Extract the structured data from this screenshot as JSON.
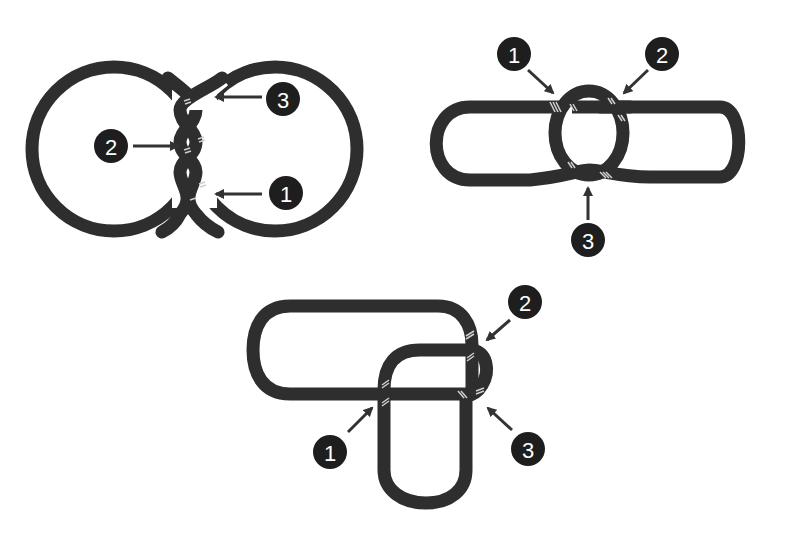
{
  "figure": {
    "background": "#ffffff",
    "rope_color": "#2e2e2e",
    "badge_color": "#1e1e1e",
    "panels": [
      {
        "id": "two-ring-twist",
        "description": "Two overlapping circles twisted together at their intersection",
        "labels": [
          {
            "number": "1",
            "target": "lower twist crossing"
          },
          {
            "number": "2",
            "target": "middle twist crossing"
          },
          {
            "number": "3",
            "target": "upper twist crossing"
          }
        ]
      },
      {
        "id": "ring-through-loop",
        "description": "Small oval ring passing through a long horizontal loop",
        "labels": [
          {
            "number": "1",
            "target": "upper-left crossing"
          },
          {
            "number": "2",
            "target": "upper-right crossing"
          },
          {
            "number": "3",
            "target": "bottom crossing"
          }
        ]
      },
      {
        "id": "interlocked-loops",
        "description": "Horizontal rounded loop interlocked with vertical rounded loop",
        "labels": [
          {
            "number": "1",
            "target": "left crossing"
          },
          {
            "number": "2",
            "target": "upper-right crossing"
          },
          {
            "number": "3",
            "target": "lower-right crossing"
          }
        ]
      }
    ]
  }
}
